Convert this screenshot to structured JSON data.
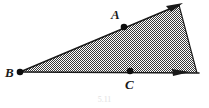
{
  "figure": {
    "kind": "geometry-diagram",
    "background_color": "#ffffff",
    "stroke_color": "#1a1a1a",
    "fill_description": "checkerboard halftone gray stipple",
    "fill_color": "#8f8f8f",
    "caption": "5.11",
    "labels": {
      "a": "A",
      "b": "B",
      "c": "C"
    },
    "points": [
      {
        "name": "A",
        "label": "A",
        "x": 124,
        "y": 27,
        "on": "upper-ray"
      },
      {
        "name": "B",
        "label": "B",
        "x": 20,
        "y": 72,
        "on": "apex"
      },
      {
        "name": "C",
        "label": "C",
        "x": 130,
        "y": 71,
        "on": "lower-ray"
      }
    ],
    "rays": [
      {
        "name": "upper-ray",
        "from": "B",
        "through": "A",
        "arrow_at": [
          176,
          5
        ]
      },
      {
        "name": "lower-ray",
        "from": "B",
        "through": "C",
        "arrow_at": [
          186,
          72
        ]
      }
    ],
    "closing_edge": {
      "from": [
        179,
        6
      ],
      "to": [
        197,
        73
      ]
    },
    "shading_polygon": [
      [
        20,
        72
      ],
      [
        179,
        5
      ],
      [
        197,
        73
      ]
    ]
  }
}
